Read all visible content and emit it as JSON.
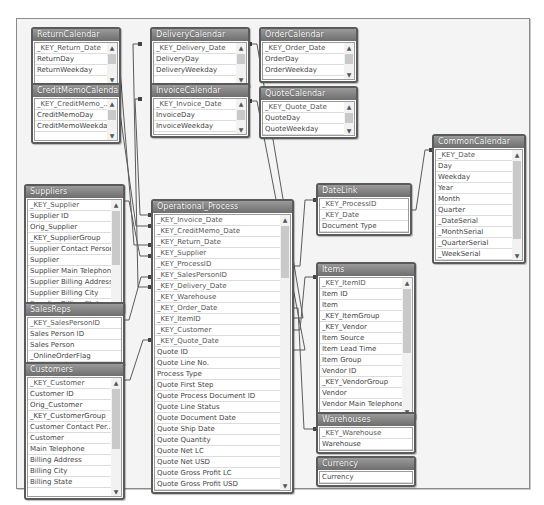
{
  "tables": {
    "returnCalendar": {
      "title": "ReturnCalendar",
      "fields": [
        "_KEY_Return_Date",
        "ReturnDay",
        "ReturnWeekday"
      ]
    },
    "creditMemoCalendar": {
      "title": "CreditMemoCalendar",
      "fields": [
        "_KEY_CreditMemo_...",
        "CreditMemoDay",
        "CreditMemoWeekday"
      ]
    },
    "deliveryCalendar": {
      "title": "DeliveryCalendar",
      "fields": [
        "_KEY_Delivery_Date",
        "DeliveryDay",
        "DeliveryWeekday"
      ]
    },
    "invoiceCalendar": {
      "title": "InvoiceCalendar",
      "fields": [
        "_KEY_Invoice_Date",
        "InvoiceDay",
        "InvoiceWeekday"
      ]
    },
    "orderCalendar": {
      "title": "OrderCalendar",
      "fields": [
        "_KEY_Order_Date",
        "OrderDay",
        "OrderWeekday"
      ]
    },
    "quoteCalendar": {
      "title": "QuoteCalendar",
      "fields": [
        "_KEY_Quote_Date",
        "QuoteDay",
        "QuoteWeekday"
      ]
    },
    "commonCalendar": {
      "title": "CommonCalendar",
      "fields": [
        "_KEY_Date",
        "Day",
        "Weekday",
        "Year",
        "Month",
        "Quarter",
        "_DateSerial",
        "_MonthSerial",
        "_QuarterSerial",
        "_WeekSerial"
      ]
    },
    "dateLink": {
      "title": "DateLink",
      "fields": [
        "_KEY_ProcessID",
        "_KEY_Date",
        "Document Type"
      ]
    },
    "suppliers": {
      "title": "Suppliers",
      "fields": [
        "_KEY_Supplier",
        "Supplier ID",
        "Orig_Supplier",
        "_KEY_SupplierGroup",
        "Supplier Contact Person",
        "Supplier",
        "Supplier Main Telephone",
        "Supplier Billing Address",
        "Supplier Billing City",
        "Supplier Billing State"
      ]
    },
    "salesReps": {
      "title": "SalesReps",
      "fields": [
        "_KEY_SalesPersonID",
        "Sales Person ID",
        "Sales Person",
        "_OnlineOrderFlag"
      ]
    },
    "customers": {
      "title": "Customers",
      "fields": [
        "_KEY_Customer",
        "Customer ID",
        "Orig_Customer",
        "_KEY_CustomerGroup",
        "Customer Contact Per...",
        "Customer",
        "Main Telephone",
        "Billing Address",
        "Billing City",
        "Billing State"
      ]
    },
    "operationalProcess": {
      "title": "Operational_Process",
      "fields": [
        "_KEY_Invoice_Date",
        "_KEY_CreditMemo_Date",
        "_KEY_Return_Date",
        "_KEY_Supplier",
        "_KEY_ProcessID",
        "_KEY_SalesPersonID",
        "_KEY_Delivery_Date",
        "_KEY_Warehouse",
        "_KEY_Order_Date",
        "_KEY_ItemID",
        "_KEY_Customer",
        "_KEY_Quote_Date",
        "Quote ID",
        "Quote Line No.",
        "Process Type",
        "Quote First Step",
        "Quote Process Document ID",
        "Quote Line Status",
        "Quote Document Date",
        "Quote Ship Date",
        "Quote Quantity",
        "Quote Net LC",
        "Quote Net USD",
        "Quote Gross Profit LC",
        "Quote Gross Profit USD"
      ]
    },
    "items": {
      "title": "Items",
      "fields": [
        "_KEY_ItemID",
        "Item ID",
        "Item",
        "_KEY_ItemGroup",
        "_KEY_Vendor",
        "Item Source",
        "Item Lead Time",
        "Item Group",
        "Vendor ID",
        "_KEY_VendorGroup",
        "Vendor",
        "Vendor Main Telephone"
      ]
    },
    "warehouses": {
      "title": "Warehouses",
      "fields": [
        "_KEY_Warehouse",
        "Warehouse"
      ]
    },
    "currency": {
      "title": "Currency",
      "fields": [
        "Currency"
      ]
    }
  },
  "scroll": {
    "up_glyph": "▲",
    "down_glyph": "▼"
  },
  "colors": {
    "header": "#7a7a7a",
    "link": "#5a5a5a",
    "canvas": "#f4f4f4"
  }
}
